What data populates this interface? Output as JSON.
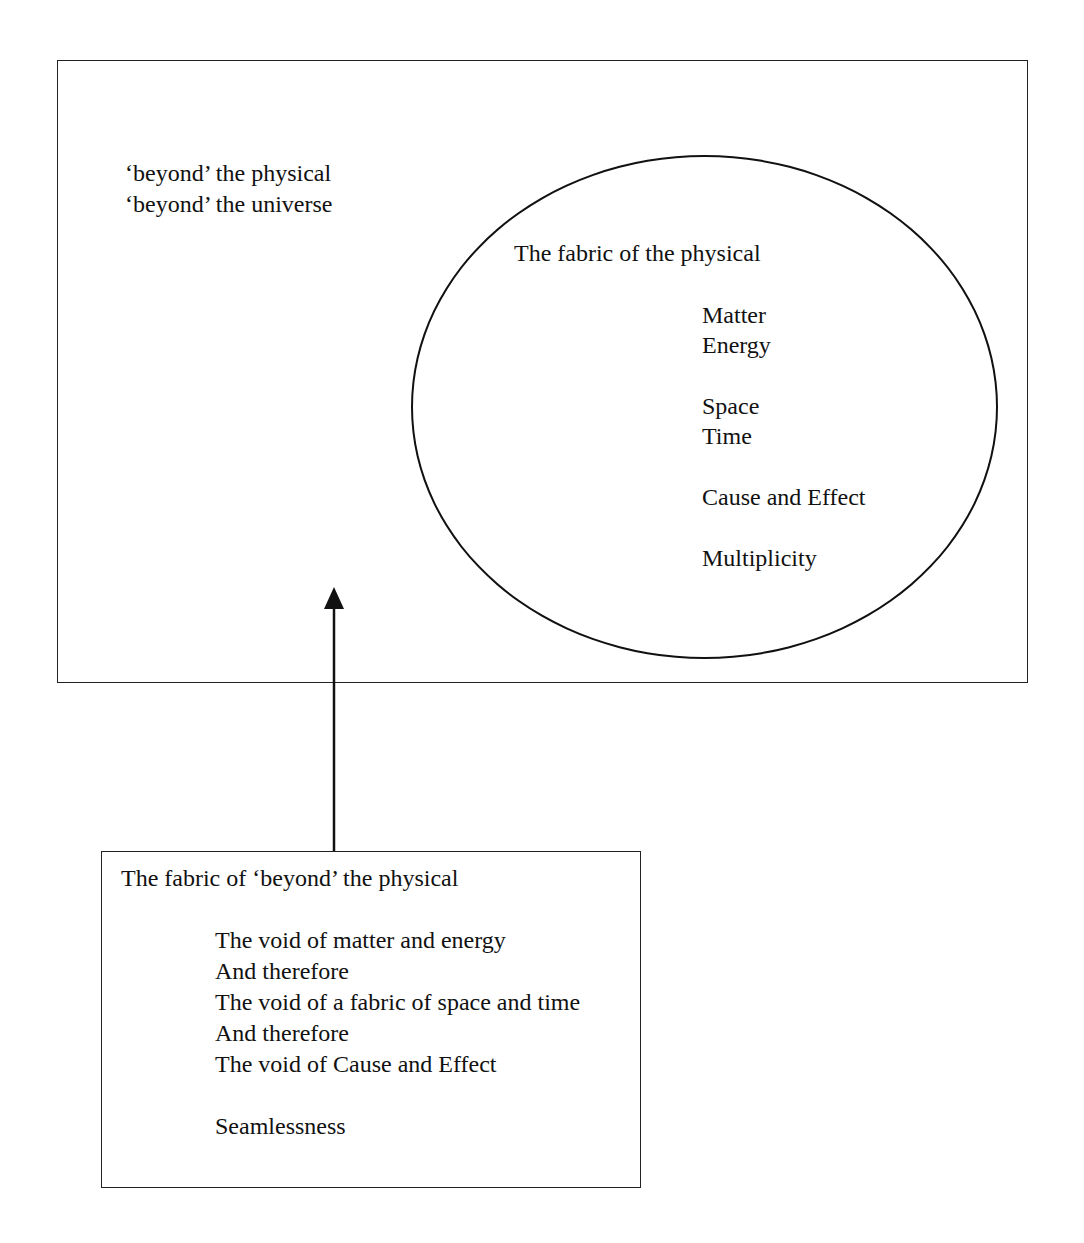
{
  "diagram": {
    "outer_region": {
      "labels": [
        "‘beyond’ the physical",
        "‘beyond’ the universe"
      ]
    },
    "physical_ellipse": {
      "title": "The fabric of the physical",
      "items": [
        "Matter",
        "Energy",
        "",
        "Space",
        "Time",
        "",
        "Cause and Effect",
        "",
        "Multiplicity"
      ]
    },
    "beyond_box": {
      "title": "The fabric of ‘beyond’ the physical",
      "items": [
        "The void of matter and energy",
        "And therefore",
        "The void of a fabric of space and time",
        "And therefore",
        "The void of Cause and Effect",
        "",
        "Seamlessness"
      ]
    },
    "arrow": {
      "direction": "up",
      "from": "beyond_box",
      "to": "outer_region"
    },
    "colors": {
      "line": "#111111",
      "background": "#ffffff",
      "text": "#111111"
    }
  }
}
